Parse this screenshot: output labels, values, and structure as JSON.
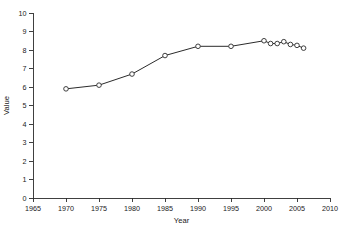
{
  "chart_data": {
    "type": "line",
    "title": "",
    "subtitle": "",
    "xlabel": "Year",
    "ylabel": "Value",
    "xlim": [
      1965,
      2010
    ],
    "ylim": [
      0,
      10
    ],
    "xticks": [
      1965,
      1970,
      1975,
      1980,
      1985,
      1990,
      1995,
      2000,
      2005,
      2010
    ],
    "xtick_labels": [
      "1965",
      "1970",
      "1975",
      "1980",
      "1985",
      "1990",
      "1995",
      "2000",
      "2005",
      "2010"
    ],
    "yticks": [
      0,
      1,
      2,
      3,
      4,
      5,
      6,
      7,
      8,
      9,
      10
    ],
    "ytick_labels": [
      "0",
      "1",
      "2",
      "3",
      "4",
      "5",
      "6",
      "7",
      "8",
      "9",
      "10"
    ],
    "grid": false,
    "legend": false,
    "legend_position": "none",
    "marker": "open-circle",
    "line_color": "#2b2b2b",
    "marker_face_color": "#ffffff",
    "marker_edge_color": "#2b2b2b",
    "annotations": [],
    "series": [
      {
        "name": "Value",
        "x": [
          1970,
          1975,
          1980,
          1985,
          1990,
          1995,
          2000,
          2001,
          2002,
          2003,
          2004,
          2005,
          2006
        ],
        "values": [
          5.9,
          6.1,
          6.7,
          7.7,
          8.2,
          8.2,
          8.5,
          8.35,
          8.35,
          8.45,
          8.3,
          8.25,
          8.1
        ]
      }
    ]
  }
}
